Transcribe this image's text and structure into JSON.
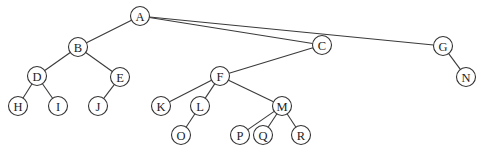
{
  "diagram": {
    "type": "tree",
    "node_radius": 9.5,
    "colors": {
      "stroke": "#333333",
      "fill": "#ffffff",
      "text": "#222222"
    },
    "nodes": [
      {
        "id": "A",
        "label": "A",
        "x": 140,
        "y": 16
      },
      {
        "id": "B",
        "label": "B",
        "x": 78,
        "y": 47
      },
      {
        "id": "C",
        "label": "C",
        "x": 322,
        "y": 45
      },
      {
        "id": "G",
        "label": "G",
        "x": 443,
        "y": 46
      },
      {
        "id": "D",
        "label": "D",
        "x": 37,
        "y": 76
      },
      {
        "id": "E",
        "label": "E",
        "x": 120,
        "y": 77
      },
      {
        "id": "F",
        "label": "F",
        "x": 220,
        "y": 76
      },
      {
        "id": "N",
        "label": "N",
        "x": 466,
        "y": 77
      },
      {
        "id": "H",
        "label": "H",
        "x": 18,
        "y": 106
      },
      {
        "id": "I",
        "label": "I",
        "x": 58,
        "y": 106
      },
      {
        "id": "J",
        "label": "J",
        "x": 98,
        "y": 106
      },
      {
        "id": "K",
        "label": "K",
        "x": 161,
        "y": 106
      },
      {
        "id": "L",
        "label": "L",
        "x": 200,
        "y": 106
      },
      {
        "id": "M",
        "label": "M",
        "x": 282,
        "y": 106
      },
      {
        "id": "O",
        "label": "O",
        "x": 181,
        "y": 135
      },
      {
        "id": "P",
        "label": "P",
        "x": 240,
        "y": 135
      },
      {
        "id": "Q",
        "label": "Q",
        "x": 263,
        "y": 135
      },
      {
        "id": "R",
        "label": "R",
        "x": 301,
        "y": 135
      }
    ],
    "edges": [
      [
        "A",
        "B"
      ],
      [
        "A",
        "C"
      ],
      [
        "A",
        "G"
      ],
      [
        "B",
        "D"
      ],
      [
        "B",
        "E"
      ],
      [
        "C",
        "F"
      ],
      [
        "G",
        "N"
      ],
      [
        "D",
        "H"
      ],
      [
        "D",
        "I"
      ],
      [
        "E",
        "J"
      ],
      [
        "F",
        "K"
      ],
      [
        "F",
        "L"
      ],
      [
        "F",
        "M"
      ],
      [
        "L",
        "O"
      ],
      [
        "M",
        "P"
      ],
      [
        "M",
        "Q"
      ],
      [
        "M",
        "R"
      ]
    ]
  }
}
